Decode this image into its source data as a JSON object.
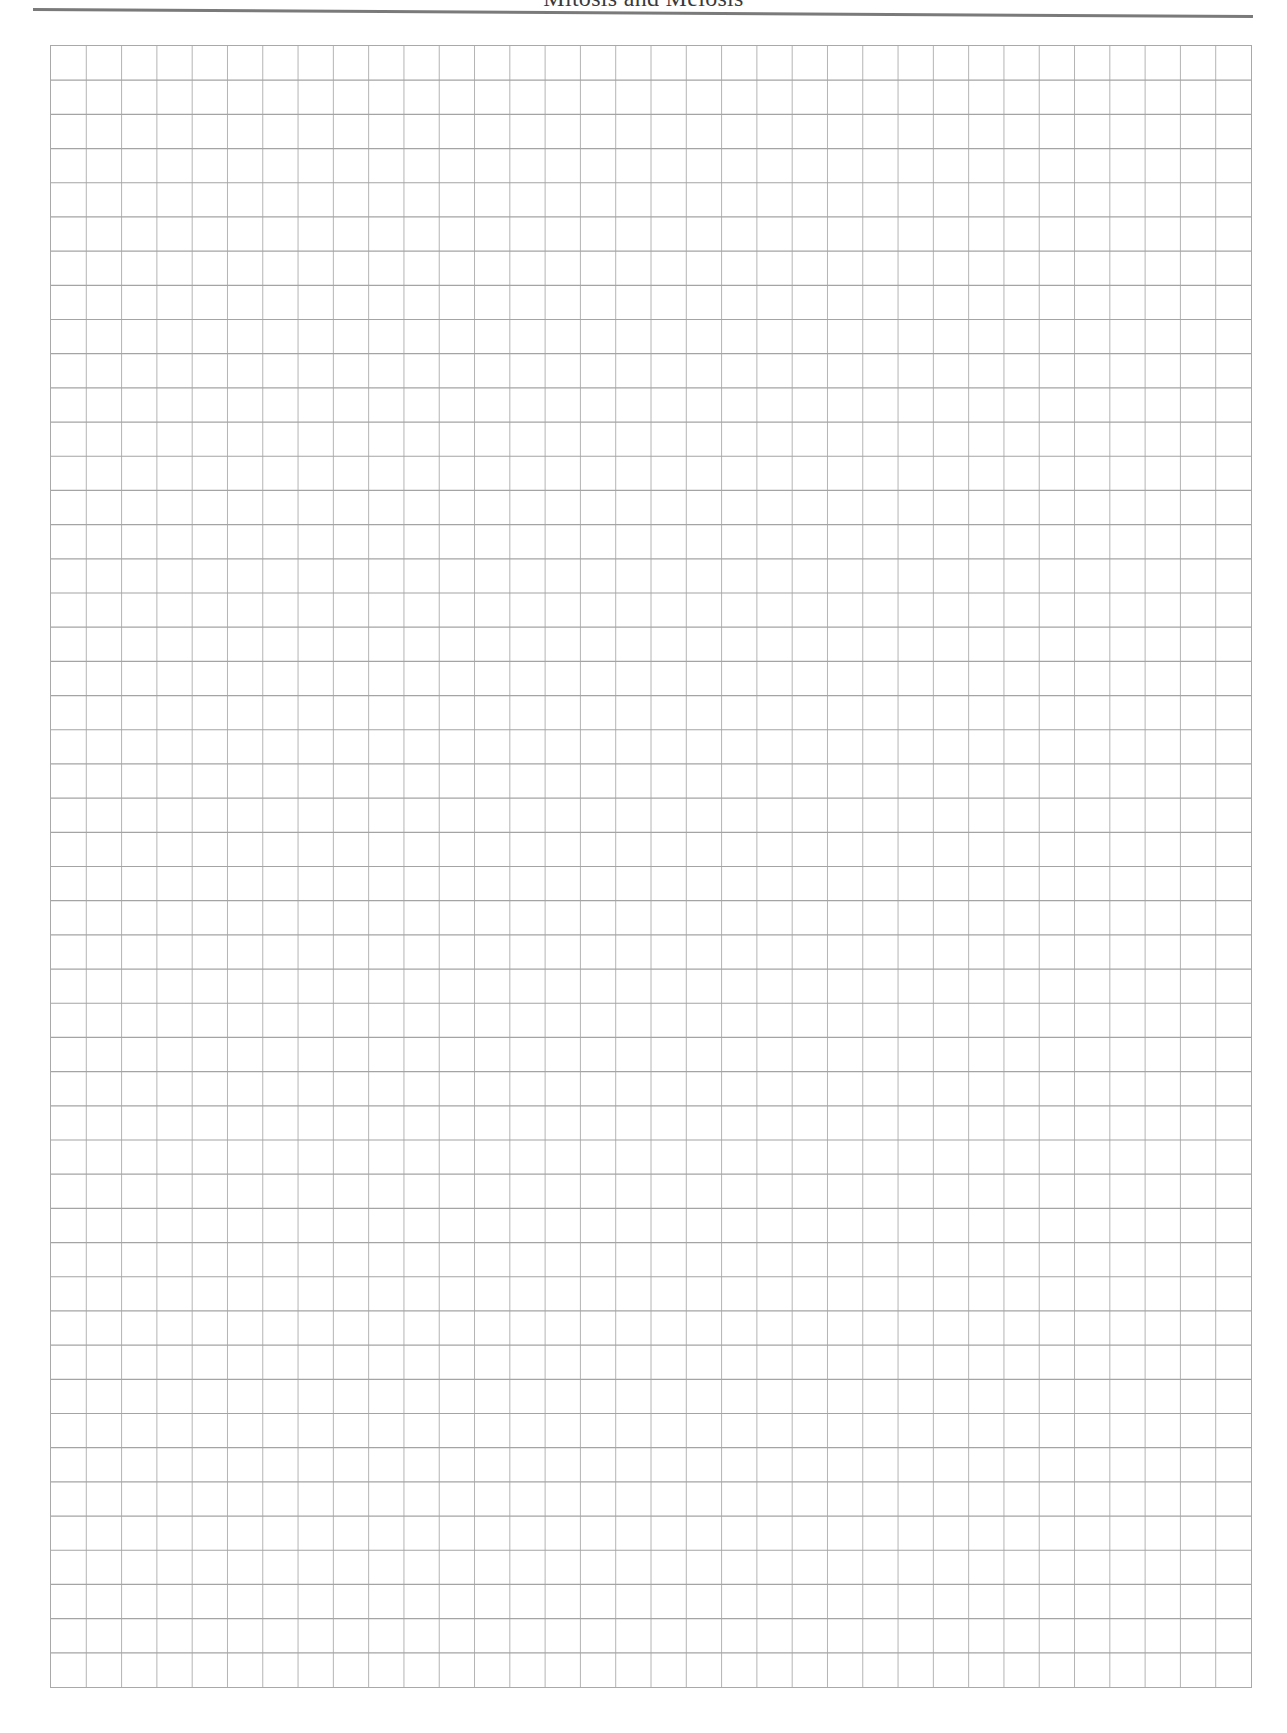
{
  "page": {
    "running_head": "Mitosis and Meiosis"
  },
  "graph_paper": {
    "columns": 34,
    "rows": 48,
    "line_color_vertical": "#b4b4b4",
    "line_color_horizontal": "#a4a4a4",
    "border_color": "#a9a9a9",
    "rule_color": "#7a7a7a"
  }
}
